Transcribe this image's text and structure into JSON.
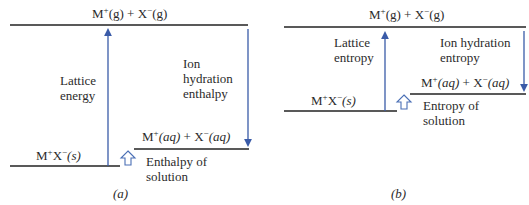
{
  "diagram_a": {
    "caption": "(a)",
    "top_state": {
      "m": "M",
      "m_sup": "+",
      "m_phase": "(g)",
      "plus": " + ",
      "x": "X",
      "x_sup": "−",
      "x_phase": "(g)"
    },
    "solid_state": {
      "m": "M",
      "m_sup": "+",
      "x": "X",
      "x_sup": "−",
      "phase": "(s)"
    },
    "aq_state": {
      "m": "M",
      "m_sup": "+",
      "m_phase": "(aq)",
      "plus": " + ",
      "x": "X",
      "x_sup": "−",
      "x_phase": "(aq)"
    },
    "up_arrow_label": [
      "Lattice",
      "energy"
    ],
    "down_arrow_label": [
      "Ion",
      "hydration",
      "enthalpy"
    ],
    "solution_label": [
      "Enthalpy of",
      "solution"
    ]
  },
  "diagram_b": {
    "caption": "(b)",
    "top_state": {
      "m": "M",
      "m_sup": "+",
      "m_phase": "(g)",
      "plus": " + ",
      "x": "X",
      "x_sup": "−",
      "x_phase": "(g)"
    },
    "solid_state": {
      "m": "M",
      "m_sup": "+",
      "x": "X",
      "x_sup": "−",
      "phase": "(s)"
    },
    "aq_state": {
      "m": "M",
      "m_sup": "+",
      "m_phase": "(aq)",
      "plus": " + ",
      "x": "X",
      "x_sup": "−",
      "x_phase": "(aq)"
    },
    "up_arrow_label": [
      "Lattice",
      "entropy"
    ],
    "down_arrow_label": [
      "Ion hydration",
      "entropy"
    ],
    "solution_label": [
      "Entropy of",
      "solution"
    ]
  },
  "colors": {
    "arrow": "#3a5ba8",
    "level_line": "#222222",
    "hollow_arrow": "#4a6fb5"
  }
}
